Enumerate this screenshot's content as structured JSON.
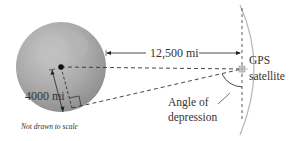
{
  "diagram": {
    "labels": {
      "distance": "12,500 mi",
      "radius": "4000 mi",
      "satellite_line1": "GPS",
      "satellite_line2": "satellite",
      "angle_line1": "Angle of",
      "angle_line2": "depression",
      "note": "Not drawn to scale"
    },
    "colors": {
      "globe": "#a8a8a8",
      "orbit": "#b5b5b5",
      "lines": "#333333",
      "text": "#333333"
    }
  }
}
